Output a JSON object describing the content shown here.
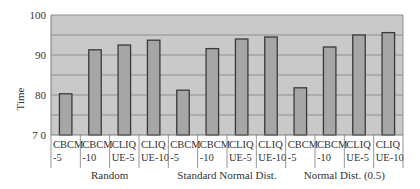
{
  "chart_data": {
    "type": "bar",
    "title": "",
    "xlabel": "",
    "ylabel": "Time",
    "ylim": [
      70,
      100
    ],
    "yticks": [
      70,
      80,
      90,
      100
    ],
    "ytick_labels": [
      "7 0",
      "80",
      "90",
      "100"
    ],
    "grid": true,
    "grid_step": 5,
    "legend": null,
    "groups": [
      {
        "label": "Random",
        "categories": [
          {
            "line1": "CBCM",
            "line2": "-5",
            "value": 80.3
          },
          {
            "line1": "CBCM",
            "line2": "-10",
            "value": 91.3
          },
          {
            "line1": "CLIQ",
            "line2": "UE-5",
            "value": 92.5
          },
          {
            "line1": "CLIQ",
            "line2": "UE-10",
            "value": 93.7
          }
        ]
      },
      {
        "label": "Standard Normal Dist.",
        "categories": [
          {
            "line1": "CBCM",
            "line2": "-5",
            "value": 81.2
          },
          {
            "line1": "CBCM",
            "line2": "-10",
            "value": 91.6
          },
          {
            "line1": "CLIQ",
            "line2": "UE-5",
            "value": 94.0
          },
          {
            "line1": "CLIQ",
            "line2": "UE-10",
            "value": 94.5
          }
        ]
      },
      {
        "label": "Normal Dist. (0.5)",
        "categories": [
          {
            "line1": "CBCM",
            "line2": "-5",
            "value": 81.8
          },
          {
            "line1": "CBCM",
            "line2": "-10",
            "value": 92.0
          },
          {
            "line1": "CLIQ",
            "line2": "UE-5",
            "value": 95.0
          },
          {
            "line1": "CLIQ",
            "line2": "UE-10",
            "value": 95.6
          }
        ]
      }
    ],
    "categories": [
      "CBCM-5",
      "CBCM-10",
      "CLIQUE-5",
      "CLIQUE-10",
      "CBCM-5",
      "CBCM-10",
      "CLIQUE-5",
      "CLIQUE-10",
      "CBCM-5",
      "CBCM-10",
      "CLIQUE-5",
      "CLIQUE-10"
    ],
    "values": [
      80.3,
      91.3,
      92.5,
      93.7,
      81.2,
      91.6,
      94.0,
      94.5,
      81.8,
      92.0,
      95.0,
      95.6
    ]
  },
  "colors": {
    "plot_bg": "#c9c9c9",
    "bar_fill": "#a6a6a6",
    "bar_stroke": "#3a3a3a",
    "grid": "#8f8f8f",
    "axis": "#7a7a7a"
  }
}
